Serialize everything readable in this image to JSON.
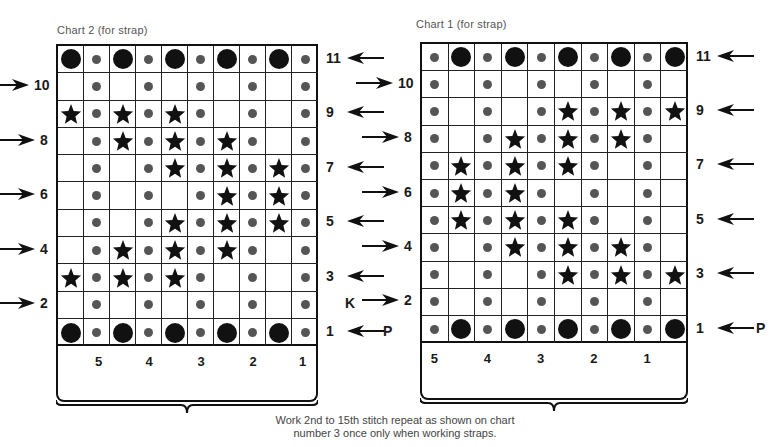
{
  "chart2": {
    "title": "Chart 2 (for strap)",
    "rows_top_to_bottom": [
      {
        "row": 11,
        "cells": [
          "big",
          "dot",
          "big",
          "dot",
          "big",
          "dot",
          "big",
          "dot",
          "big",
          "dot"
        ]
      },
      {
        "row": 10,
        "cells": [
          "",
          "dot",
          "",
          "dot",
          "",
          "dot",
          "",
          "dot",
          "",
          "dot"
        ]
      },
      {
        "row": 9,
        "cells": [
          "star",
          "dot",
          "star",
          "dot",
          "star",
          "dot",
          "",
          "dot",
          "",
          "dot"
        ]
      },
      {
        "row": 8,
        "cells": [
          "",
          "dot",
          "star",
          "dot",
          "star",
          "dot",
          "star",
          "dot",
          "",
          "dot"
        ]
      },
      {
        "row": 7,
        "cells": [
          "",
          "dot",
          "",
          "dot",
          "star",
          "dot",
          "star",
          "dot",
          "star",
          "dot"
        ]
      },
      {
        "row": 6,
        "cells": [
          "",
          "dot",
          "",
          "dot",
          "",
          "dot",
          "star",
          "dot",
          "star",
          "dot"
        ]
      },
      {
        "row": 5,
        "cells": [
          "",
          "dot",
          "",
          "dot",
          "star",
          "dot",
          "star",
          "dot",
          "star",
          "dot"
        ]
      },
      {
        "row": 4,
        "cells": [
          "",
          "dot",
          "star",
          "dot",
          "star",
          "dot",
          "star",
          "dot",
          "",
          "dot"
        ]
      },
      {
        "row": 3,
        "cells": [
          "star",
          "dot",
          "star",
          "dot",
          "star",
          "dot",
          "",
          "dot",
          "",
          "dot"
        ]
      },
      {
        "row": 2,
        "cells": [
          "",
          "dot",
          "",
          "dot",
          "",
          "dot",
          "",
          "dot",
          "",
          "dot"
        ]
      },
      {
        "row": 1,
        "cells": [
          "big",
          "dot",
          "big",
          "dot",
          "big",
          "dot",
          "big",
          "dot",
          "big",
          "dot"
        ]
      }
    ],
    "right_labels": [
      {
        "text": "11",
        "row": 11
      },
      {
        "text": "9",
        "row": 9
      },
      {
        "text": "7",
        "row": 7
      },
      {
        "text": "5",
        "row": 5
      },
      {
        "text": "3",
        "row": 3
      },
      {
        "text": "1",
        "row": 1
      }
    ],
    "left_labels": [
      {
        "text": "10",
        "row": 10
      },
      {
        "text": "8",
        "row": 8
      },
      {
        "text": "6",
        "row": 6
      },
      {
        "text": "4",
        "row": 4
      },
      {
        "text": "2",
        "row": 2
      }
    ],
    "stitch_numbers": [
      "5",
      "4",
      "3",
      "2",
      "1"
    ],
    "k_label": "K",
    "p_label": "P"
  },
  "chart1": {
    "title": "Chart 1 (for strap)",
    "rows_top_to_bottom": [
      {
        "row": 11,
        "cells": [
          "dot",
          "big",
          "dot",
          "big",
          "dot",
          "big",
          "dot",
          "big",
          "dot",
          "big"
        ]
      },
      {
        "row": 10,
        "cells": [
          "dot",
          "",
          "dot",
          "",
          "dot",
          "",
          "dot",
          "",
          "dot",
          ""
        ]
      },
      {
        "row": 9,
        "cells": [
          "dot",
          "",
          "dot",
          "",
          "dot",
          "star",
          "dot",
          "star",
          "dot",
          "star"
        ]
      },
      {
        "row": 8,
        "cells": [
          "dot",
          "",
          "dot",
          "star",
          "dot",
          "star",
          "dot",
          "star",
          "dot",
          ""
        ]
      },
      {
        "row": 7,
        "cells": [
          "dot",
          "star",
          "dot",
          "star",
          "dot",
          "star",
          "dot",
          "",
          "dot",
          ""
        ]
      },
      {
        "row": 6,
        "cells": [
          "dot",
          "star",
          "dot",
          "star",
          "dot",
          "",
          "dot",
          "",
          "dot",
          ""
        ]
      },
      {
        "row": 5,
        "cells": [
          "dot",
          "star",
          "dot",
          "star",
          "dot",
          "star",
          "dot",
          "",
          "dot",
          ""
        ]
      },
      {
        "row": 4,
        "cells": [
          "dot",
          "",
          "dot",
          "star",
          "dot",
          "star",
          "dot",
          "star",
          "dot",
          ""
        ]
      },
      {
        "row": 3,
        "cells": [
          "dot",
          "",
          "dot",
          "",
          "dot",
          "star",
          "dot",
          "star",
          "dot",
          "star"
        ]
      },
      {
        "row": 2,
        "cells": [
          "dot",
          "",
          "dot",
          "",
          "dot",
          "",
          "dot",
          "",
          "dot",
          ""
        ]
      },
      {
        "row": 1,
        "cells": [
          "dot",
          "big",
          "dot",
          "big",
          "dot",
          "big",
          "dot",
          "big",
          "dot",
          "big"
        ]
      }
    ],
    "right_labels": [
      {
        "text": "11",
        "row": 11
      },
      {
        "text": "9",
        "row": 9
      },
      {
        "text": "7",
        "row": 7
      },
      {
        "text": "5",
        "row": 5
      },
      {
        "text": "3",
        "row": 3
      },
      {
        "text": "1",
        "row": 1
      }
    ],
    "left_labels": [
      {
        "text": "10",
        "row": 10
      },
      {
        "text": "8",
        "row": 8
      },
      {
        "text": "6",
        "row": 6
      },
      {
        "text": "4",
        "row": 4
      },
      {
        "text": "2",
        "row": 2
      }
    ],
    "stitch_numbers": [
      "5",
      "4",
      "3",
      "2",
      "1"
    ],
    "p_label": "P"
  },
  "caption": {
    "line1": "Work 2nd to 15th stitch repeat as shown on chart",
    "line2": "number 3 once only when working straps."
  },
  "symbols": {
    "big": "large filled circle",
    "dot": "small grey dot",
    "star": "five-point star",
    "": "blank cell"
  }
}
